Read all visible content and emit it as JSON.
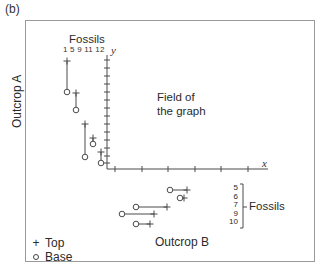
{
  "panel_label": "(b)",
  "outcrop_a": {
    "label": "Outcrop A",
    "fossils_label": "Fossils",
    "fossil_numbers": [
      "1",
      "5",
      "9",
      "11",
      "12"
    ],
    "fossil_numbers_text": "1 5 9 11 12",
    "ranges": [
      {
        "fossil": "1",
        "x": 67,
        "top_y": 61,
        "base_y": 92
      },
      {
        "fossil": "5",
        "x": 76,
        "top_y": 93,
        "base_y": 110
      },
      {
        "fossil": "9",
        "x": 85,
        "top_y": 124,
        "base_y": 157
      },
      {
        "fossil": "11",
        "x": 93,
        "top_y": 138,
        "base_y": 144
      },
      {
        "fossil": "12",
        "x": 101,
        "top_y": 152,
        "base_y": 163
      }
    ]
  },
  "outcrop_b": {
    "label": "Outcrop B",
    "fossils_label": "Fossils",
    "fossil_numbers": [
      "5",
      "6",
      "7",
      "9",
      "10"
    ],
    "ranges": [
      {
        "fossil": "5",
        "y": 190,
        "base_x": 170,
        "top_x": 187
      },
      {
        "fossil": "6",
        "y": 198,
        "base_x": 180,
        "top_x": 184
      },
      {
        "fossil": "7",
        "y": 207,
        "base_x": 136,
        "top_x": 167
      },
      {
        "fossil": "9",
        "y": 214,
        "base_x": 122,
        "top_x": 154
      },
      {
        "fossil": "10",
        "y": 224,
        "base_x": 136,
        "top_x": 150
      }
    ]
  },
  "graph": {
    "field_label_line1": "Field of",
    "field_label_line2": "the graph",
    "x_axis_label": "x",
    "y_axis_label": "y",
    "y_ticks": [
      60,
      68,
      76,
      84,
      92,
      100,
      108,
      116,
      124,
      132,
      140,
      148,
      156,
      163
    ],
    "x_ticks": [
      115,
      142,
      168,
      195,
      221,
      248
    ]
  },
  "legend": {
    "top_symbol": "+",
    "top_label": "Top",
    "base_symbol": "o",
    "base_label": "Base"
  },
  "colors": {
    "line": "#4a4a4a",
    "frame": "#9a9a9a",
    "text": "#2b2b2b"
  }
}
